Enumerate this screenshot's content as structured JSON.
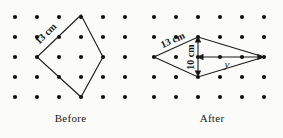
{
  "figure": {
    "background_color": "#fbfbf9",
    "ink_color": "#1a1a1a",
    "dot_color": "#111111",
    "grid": {
      "columns": 6,
      "rows": 5,
      "spacing_x": 22,
      "spacing_y": 20,
      "dot_radius": 2.1
    }
  },
  "panels": [
    {
      "id": "before",
      "caption": "Before",
      "shape": "square-rotated-45",
      "vertices_grid": [
        [
          3,
          0
        ],
        [
          5,
          2
        ],
        [
          3,
          4
        ],
        [
          1,
          2
        ]
      ],
      "labels": [
        {
          "name": "side-length",
          "text": "13 cm",
          "rotation_deg": -44
        }
      ]
    },
    {
      "id": "after",
      "caption": "After",
      "shape": "rhombus",
      "vertices_grid": [
        [
          2,
          1
        ],
        [
          5,
          2
        ],
        [
          2,
          3
        ],
        [
          0,
          2
        ]
      ],
      "labels": [
        {
          "name": "side-length",
          "text": "13 cm",
          "rotation_deg": -24
        },
        {
          "name": "vertical-diagonal",
          "text": "10 cm",
          "rotation_deg": -90
        },
        {
          "name": "horizontal-half-diagonal",
          "text": "y",
          "rotation_deg": 0
        }
      ]
    }
  ],
  "captions": {
    "before": "Before",
    "after": "After"
  },
  "measurements": {
    "before_side": "13 cm",
    "after_side": "13 cm",
    "after_vertical": "10 cm",
    "after_horizontal_unknown": "y"
  }
}
